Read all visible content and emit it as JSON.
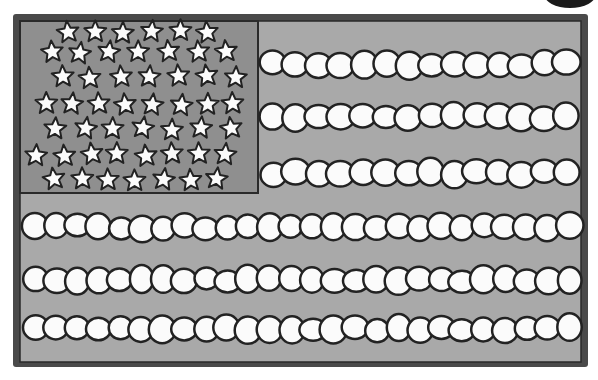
{
  "image": {
    "subject": "Hand-drawn grayscale American flag illustration",
    "width": 598,
    "height": 380
  },
  "colors": {
    "background": "#ffffff",
    "frame": "#4a4a4a",
    "field": "#a9a9a9",
    "canton": "#8f8f8f",
    "outline": "#222222",
    "fill": "#fbfbfb"
  },
  "flag": {
    "frame": {
      "x": 13,
      "y": 14,
      "w": 575,
      "h": 353
    },
    "field": {
      "x": 20,
      "y": 21,
      "w": 561,
      "h": 341
    },
    "canton": {
      "x": 20,
      "y": 21,
      "w": 238,
      "h": 172
    },
    "star_rows": [
      {
        "y": 32,
        "x_start": 68,
        "count": 6,
        "gap": 28
      },
      {
        "y": 52,
        "x_start": 52,
        "count": 7,
        "gap": 29
      },
      {
        "y": 77,
        "x_start": 62,
        "count": 7,
        "gap": 29
      },
      {
        "y": 104,
        "x_start": 45,
        "count": 8,
        "gap": 27
      },
      {
        "y": 129,
        "x_start": 56,
        "count": 7,
        "gap": 29
      },
      {
        "y": 155,
        "x_start": 37,
        "count": 8,
        "gap": 27
      },
      {
        "y": 180,
        "x_start": 55,
        "count": 7,
        "gap": 27
      }
    ],
    "stripes_short": [
      {
        "y": 64,
        "x_start": 262,
        "x_end": 578,
        "count": 14
      },
      {
        "y": 117,
        "x_start": 262,
        "x_end": 578,
        "count": 14
      },
      {
        "y": 173,
        "x_start": 262,
        "x_end": 578,
        "count": 14
      }
    ],
    "stripes_long": [
      {
        "y": 227,
        "x_start": 24,
        "x_end": 580,
        "count": 26
      },
      {
        "y": 280,
        "x_start": 24,
        "x_end": 580,
        "count": 26
      },
      {
        "y": 329,
        "x_start": 24,
        "x_end": 580,
        "count": 26
      }
    ]
  },
  "corner_mark": {
    "cx": 570,
    "cy": -6,
    "rx": 26,
    "ry": 14
  }
}
